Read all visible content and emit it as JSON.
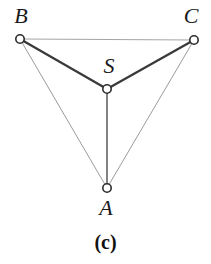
{
  "figure": {
    "caption": "(c)",
    "background_color": "#ffffff",
    "width": 211,
    "height": 264
  },
  "graph": {
    "node_style": {
      "radius": 4.2,
      "fill": "#ffffff",
      "stroke": "#2b2b2b",
      "stroke_width": 1.6
    },
    "nodes": [
      {
        "id": "B",
        "label": "B",
        "x": 20,
        "y": 39,
        "label_x": 21,
        "label_y": 16
      },
      {
        "id": "C",
        "label": "C",
        "x": 194,
        "y": 40,
        "label_x": 191,
        "label_y": 16
      },
      {
        "id": "S",
        "label": "S",
        "x": 107,
        "y": 89,
        "label_x": 109,
        "label_y": 66
      },
      {
        "id": "A",
        "label": "A",
        "x": 107,
        "y": 188,
        "label_x": 106,
        "label_y": 208
      }
    ],
    "edges": [
      {
        "from": "B",
        "to": "C",
        "kind": "thin",
        "color": "#9a9a9a",
        "width": 0.9
      },
      {
        "from": "B",
        "to": "A",
        "kind": "thin",
        "color": "#8e8e8e",
        "width": 0.9
      },
      {
        "from": "C",
        "to": "A",
        "kind": "thin",
        "color": "#8e8e8e",
        "width": 0.9
      },
      {
        "from": "B",
        "to": "S",
        "kind": "thick",
        "color": "#3a3a3a",
        "width": 2.3
      },
      {
        "from": "S",
        "to": "C",
        "kind": "thick",
        "color": "#3a3a3a",
        "width": 2.3
      },
      {
        "from": "S",
        "to": "A",
        "kind": "medium",
        "color": "#5a5a5a",
        "width": 1.5
      }
    ]
  }
}
